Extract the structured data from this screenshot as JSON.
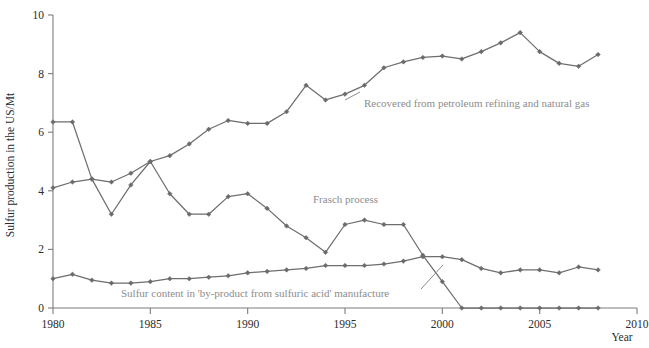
{
  "chart_data": {
    "type": "line",
    "title": "",
    "xlabel": "Year",
    "ylabel": "Sulfur production in the US/Mt",
    "xlim": [
      1980,
      2010
    ],
    "ylim": [
      0,
      10
    ],
    "xticks": [
      1980,
      1985,
      1990,
      1995,
      2000,
      2005,
      2010
    ],
    "xticklabels": [
      "1980",
      "1985",
      "1990",
      "1995",
      "2000",
      "2005",
      "2010"
    ],
    "yticks": [
      0,
      2,
      4,
      6,
      8,
      10
    ],
    "yticklabels": [
      "0",
      "2",
      "4",
      "6",
      "8",
      "10"
    ],
    "grid": false,
    "legend": "inline-annotations",
    "x": [
      1980,
      1981,
      1982,
      1983,
      1984,
      1985,
      1986,
      1987,
      1988,
      1989,
      1990,
      1991,
      1992,
      1993,
      1994,
      1995,
      1996,
      1997,
      1998,
      1999,
      2000,
      2001,
      2002,
      2003,
      2004,
      2005,
      2006,
      2007,
      2008
    ],
    "series": [
      {
        "name": "Recovered from petroleum refining and natural gas",
        "values": [
          4.1,
          4.3,
          4.4,
          4.3,
          4.6,
          5.0,
          5.2,
          5.6,
          6.1,
          6.4,
          6.3,
          6.3,
          6.7,
          7.6,
          7.1,
          7.3,
          7.6,
          8.2,
          8.4,
          8.55,
          8.6,
          8.5,
          8.75,
          9.05,
          9.4,
          8.75,
          8.35,
          8.25,
          8.65
        ]
      },
      {
        "name": "Frasch process",
        "values": [
          6.35,
          6.35,
          4.4,
          3.2,
          4.2,
          5.0,
          3.9,
          3.2,
          3.2,
          3.8,
          3.9,
          3.4,
          2.8,
          2.4,
          1.9,
          2.85,
          3.0,
          2.85,
          2.85,
          1.8,
          0.9,
          0.0,
          0.0,
          0.0,
          0.0,
          0.0,
          0.0,
          0.0,
          0.0
        ]
      },
      {
        "name": "Sulfur content in 'by-product from sulfuric acid' manufacture",
        "values": [
          1.0,
          1.15,
          0.95,
          0.85,
          0.85,
          0.9,
          1.0,
          1.0,
          1.05,
          1.1,
          1.2,
          1.25,
          1.3,
          1.35,
          1.45,
          1.45,
          1.45,
          1.5,
          1.6,
          1.75,
          1.75,
          1.65,
          1.35,
          1.2,
          1.3,
          1.3,
          1.2,
          1.4,
          1.3
        ]
      }
    ],
    "annotations": [
      {
        "name": "recovered-label",
        "text": "Recovered from petroleum refining and natural gas",
        "x": 364,
        "y": 107
      },
      {
        "name": "frasch-label",
        "text": "Frasch process",
        "x": 313,
        "y": 203
      },
      {
        "name": "byproduct-label",
        "text": "Sulfur content in 'by-product from sulfuric acid' manufacture",
        "x": 121,
        "y": 297
      }
    ]
  },
  "colors": {
    "line": "#6e6e6e",
    "marker": "#6b6b6b",
    "axis": "#7d7d7d",
    "tick_text": "#2b2b2b",
    "annotation_text": "#8d8d8d",
    "background": "#ffffff"
  }
}
